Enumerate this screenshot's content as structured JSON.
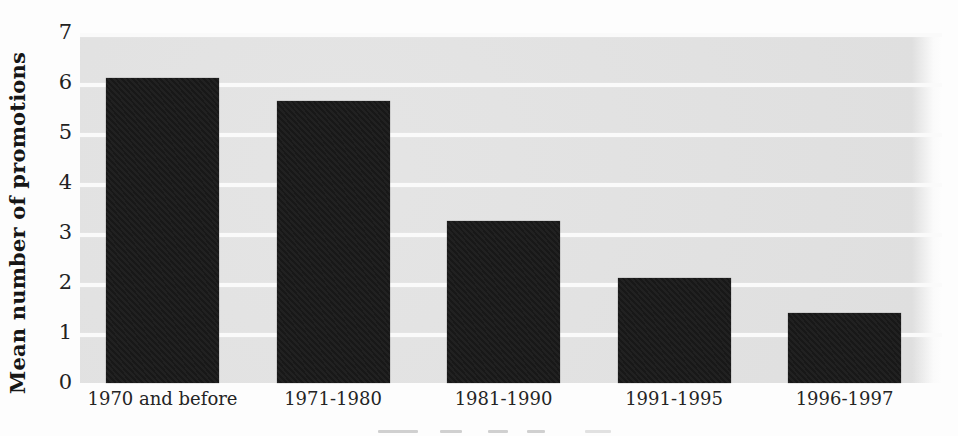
{
  "figure": {
    "type": "scanned-book-bar-chart",
    "background_color": "#fdfdfd",
    "panel_color": "#e3e3e3",
    "gridline_color": "#fafafa",
    "bar_color": "#191919",
    "text_color": "#1c1c1c"
  },
  "chart_data": {
    "type": "bar",
    "title": "",
    "ylabel": "Mean number of promotions",
    "xlabel": "",
    "categories": [
      "1970 and before",
      "1971-1980",
      "1981-1990",
      "1991-1995",
      "1996-1997"
    ],
    "values": [
      6.1,
      5.65,
      3.25,
      2.1,
      1.4
    ],
    "y_ticks": [
      0,
      1,
      2,
      3,
      4,
      5,
      6,
      7
    ],
    "ylim": [
      0,
      7
    ],
    "grid": "horizontal white gridlines at each integer on gray panel",
    "legend": "none"
  }
}
